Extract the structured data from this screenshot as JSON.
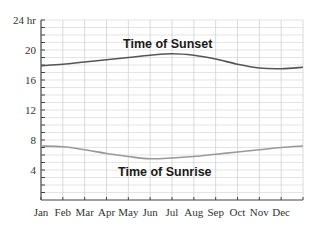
{
  "chart_data": {
    "type": "line",
    "title": "",
    "xlabel": "",
    "ylabel": "",
    "ylim": [
      0,
      24
    ],
    "y_ticks": [
      {
        "value": 24,
        "label": "24 hr"
      },
      {
        "value": 20,
        "label": "20"
      },
      {
        "value": 16,
        "label": "16"
      },
      {
        "value": 12,
        "label": "12"
      },
      {
        "value": 8,
        "label": "8"
      },
      {
        "value": 4,
        "label": "4"
      }
    ],
    "categories": [
      "Jan",
      "Feb",
      "Mar",
      "Apr",
      "May",
      "Jun",
      "Jul",
      "Aug",
      "Sep",
      "Oct",
      "Nov",
      "Dec"
    ],
    "grid": {
      "horizontal_step": 1,
      "vertical": true
    },
    "series": [
      {
        "name": "Time of Sunset",
        "color": "#555555",
        "x": [
          0,
          1,
          2,
          3,
          4,
          5,
          6,
          7,
          8,
          9,
          10,
          11,
          12
        ],
        "values": [
          17.9,
          18.1,
          18.4,
          18.7,
          19.0,
          19.3,
          19.5,
          19.3,
          18.8,
          18.1,
          17.6,
          17.5,
          17.7
        ]
      },
      {
        "name": "Time of Sunrise",
        "color": "#999999",
        "x": [
          0,
          1,
          2,
          3,
          4,
          5,
          6,
          7,
          8,
          9,
          10,
          11,
          12
        ],
        "values": [
          7.2,
          7.1,
          6.7,
          6.2,
          5.8,
          5.5,
          5.6,
          5.8,
          6.1,
          6.4,
          6.7,
          7.0,
          7.2
        ]
      }
    ],
    "annotations": [
      {
        "text": "Time of Sunset",
        "x": 5.3,
        "y": 21.2
      },
      {
        "text": "Time of Sunrise",
        "x": 5.1,
        "y": 4.1
      }
    ],
    "legend": "none (inline labels)"
  },
  "labels": {
    "sunset": "Time of Sunset",
    "sunrise": "Time of Sunrise"
  }
}
